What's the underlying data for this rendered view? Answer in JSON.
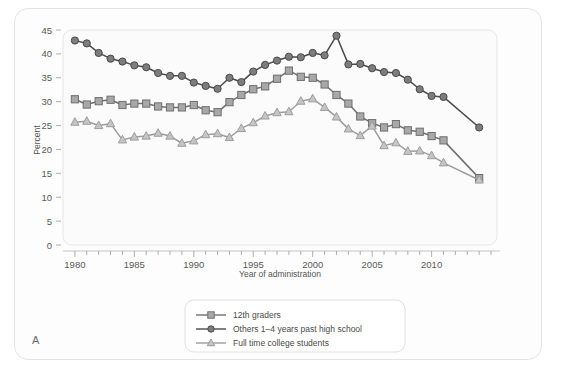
{
  "figure": {
    "panel_label": "A",
    "background_color": "#fdfdfd",
    "border_color": "#e3e3e3"
  },
  "chart_data": {
    "type": "line",
    "title": "",
    "xlabel": "Year of administration",
    "ylabel": "Percent",
    "xlim": [
      1979,
      2015.5
    ],
    "ylim": [
      0,
      45
    ],
    "ytick_step": 5,
    "yticks": [
      0,
      5,
      10,
      15,
      20,
      25,
      30,
      35,
      40,
      45
    ],
    "xticks_major": [
      1980,
      1985,
      1990,
      1995,
      2000,
      2005,
      2010
    ],
    "xtick_minor_step": 1,
    "grid": false,
    "legend_position": "bottom-center",
    "x": [
      1980,
      1981,
      1982,
      1983,
      1984,
      1985,
      1986,
      1987,
      1988,
      1989,
      1990,
      1991,
      1992,
      1993,
      1994,
      1995,
      1996,
      1997,
      1998,
      1999,
      2000,
      2001,
      2002,
      2003,
      2004,
      2005,
      2006,
      2007,
      2008,
      2009,
      2010,
      2011,
      2014
    ],
    "series": [
      {
        "name": "12th graders",
        "marker": "square",
        "color": "#6f6f6f",
        "marker_fill": "#a8a8a8",
        "values": [
          30.5,
          29.4,
          30.1,
          30.4,
          29.3,
          29.6,
          29.6,
          29.0,
          28.8,
          28.8,
          29.3,
          28.2,
          27.8,
          29.9,
          31.4,
          32.6,
          33.2,
          34.8,
          36.5,
          35.2,
          35.0,
          33.6,
          31.4,
          29.6,
          26.9,
          25.5,
          24.6,
          25.3,
          24.0,
          23.7,
          22.8,
          21.9,
          14.0
        ]
      },
      {
        "name": "Others 1–4 years past high school",
        "marker": "circle",
        "color": "#4a4a4a",
        "marker_fill": "#7d7d7d",
        "values": [
          42.8,
          42.2,
          40.2,
          39.0,
          38.4,
          37.6,
          37.2,
          36.0,
          35.4,
          35.4,
          34.0,
          33.3,
          32.7,
          35.0,
          34.1,
          36.3,
          37.7,
          38.6,
          39.4,
          39.3,
          40.2,
          39.7,
          43.8,
          37.8,
          37.9,
          37.0,
          36.2,
          36.0,
          34.6,
          32.6,
          31.2,
          31.0,
          24.6
        ]
      },
      {
        "name": "Full time college students",
        "marker": "triangle",
        "color": "#9d9d9d",
        "marker_fill": "#c5c5c5",
        "values": [
          25.7,
          25.9,
          25.0,
          25.4,
          22.0,
          22.6,
          22.8,
          23.4,
          22.8,
          21.3,
          21.8,
          23.1,
          23.3,
          22.5,
          24.4,
          25.6,
          27.0,
          27.7,
          27.9,
          30.1,
          30.6,
          28.8,
          26.8,
          24.3,
          22.9,
          24.9,
          20.8,
          21.4,
          19.6,
          19.7,
          18.7,
          17.2,
          13.6
        ]
      }
    ]
  }
}
